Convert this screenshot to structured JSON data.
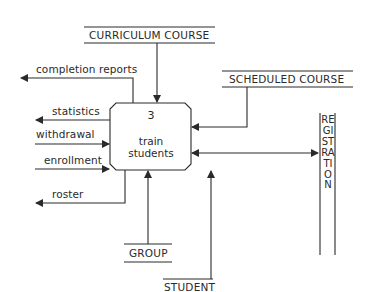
{
  "diagram": {
    "type": "data-flow-diagram",
    "process": {
      "number": "3",
      "name_line1": "train",
      "name_line2": "students"
    },
    "data_stores": {
      "curriculum_course": "CURRICULUM COURSE",
      "scheduled_course": "SCHEDULED COURSE",
      "group": "GROUP",
      "student": "STUDENT"
    },
    "external_entity": {
      "registration": "REGISTRATION"
    },
    "flows": {
      "completion_reports": "completion reports",
      "statistics": "statistics",
      "withdrawal": "withdrawal",
      "enrollment": "enrollment",
      "roster": "roster"
    },
    "colors": {
      "line": "#2a2a2a",
      "background": "#ffffff"
    }
  }
}
